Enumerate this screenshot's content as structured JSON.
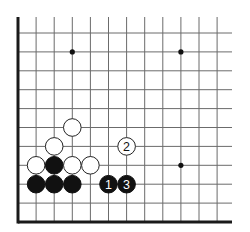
{
  "diagram": {
    "type": "go-board-fragment",
    "visible_edges": [
      "left",
      "bottom"
    ],
    "columns": 12,
    "rows": 11,
    "colors": {
      "background": "#ffffff",
      "grid": "#6b6b6b",
      "edge": "#1a1a1a",
      "black_stone": "#111111",
      "white_stone": "#ffffff",
      "stone_outline": "#222222"
    },
    "star_points": [
      {
        "col": 3,
        "row": 1
      },
      {
        "col": 9,
        "row": 1
      },
      {
        "col": 9,
        "row": 7
      }
    ],
    "stones": [
      {
        "color": "white",
        "col": 3,
        "row": 5,
        "label": ""
      },
      {
        "color": "white",
        "col": 2,
        "row": 6,
        "label": ""
      },
      {
        "color": "white",
        "col": 6,
        "row": 6,
        "label": "2"
      },
      {
        "color": "white",
        "col": 1,
        "row": 7,
        "label": ""
      },
      {
        "color": "black",
        "col": 2,
        "row": 7,
        "label": ""
      },
      {
        "color": "white",
        "col": 3,
        "row": 7,
        "label": ""
      },
      {
        "color": "white",
        "col": 4,
        "row": 7,
        "label": ""
      },
      {
        "color": "black",
        "col": 1,
        "row": 8,
        "label": ""
      },
      {
        "color": "black",
        "col": 2,
        "row": 8,
        "label": ""
      },
      {
        "color": "black",
        "col": 3,
        "row": 8,
        "label": ""
      },
      {
        "color": "black",
        "col": 5,
        "row": 8,
        "label": "1"
      },
      {
        "color": "black",
        "col": 6,
        "row": 8,
        "label": "3"
      }
    ]
  }
}
